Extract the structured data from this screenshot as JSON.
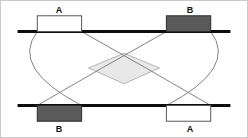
{
  "figure": {
    "title": "",
    "background_color": "#ffffff",
    "border_color": "#c9c9c9"
  },
  "chart_data": {
    "type": "diagram",
    "title": "",
    "xlabel": "",
    "ylabel": "",
    "axis_lines": [
      {
        "name": "top-line",
        "x1": 16,
        "y1": 31,
        "x2": 232,
        "y2": 31,
        "color": "#0d0d0d",
        "width": 3
      },
      {
        "name": "bottom-line",
        "x1": 16,
        "y1": 106,
        "x2": 232,
        "y2": 106,
        "color": "#0d0d0d",
        "width": 3
      }
    ],
    "blocks": [
      {
        "label": "A",
        "position": "top-left",
        "x": 36,
        "y": 15,
        "width": 45,
        "height": 16,
        "fill": "#ffffff",
        "stroke": "#555555",
        "label_y": 5,
        "label_side": "above"
      },
      {
        "label": "B",
        "position": "top-right",
        "x": 167,
        "y": 15,
        "width": 45,
        "height": 16,
        "fill": "#5a5a5a",
        "stroke": "#2b2b2b",
        "label_y": 5,
        "label_side": "above"
      },
      {
        "label": "B",
        "position": "bottom-left",
        "x": 36,
        "y": 106,
        "width": 45,
        "height": 16,
        "fill": "#5a5a5a",
        "stroke": "#2b2b2b",
        "label_y": 124,
        "label_side": "below"
      },
      {
        "label": "A",
        "position": "bottom-right",
        "x": 167,
        "y": 106,
        "width": 45,
        "height": 16,
        "fill": "#ffffff",
        "stroke": "#555555",
        "label_y": 124,
        "label_side": "below"
      }
    ],
    "curves": [
      {
        "name": "arc-left-outer",
        "from": [
          36,
          31
        ],
        "to": [
          81,
          106
        ],
        "control": [
          8,
          68
        ],
        "color": "#808080",
        "width": 1
      },
      {
        "name": "arc-right-outer",
        "from": [
          212,
          31
        ],
        "to": [
          167,
          106
        ],
        "control": [
          240,
          68
        ],
        "color": "#808080",
        "width": 1
      },
      {
        "name": "arc-top-left-to-bottom-right",
        "from": [
          81,
          31
        ],
        "to": [
          212,
          106
        ],
        "control": [
          147,
          68
        ],
        "color": "#808080",
        "width": 1
      },
      {
        "name": "arc-top-right-to-bottom-left",
        "from": [
          167,
          31
        ],
        "to": [
          36,
          106
        ],
        "control": [
          101,
          68
        ],
        "color": "#808080",
        "width": 1
      }
    ],
    "shaded_region": {
      "name": "coupling-overlap",
      "fill": "#e8e8e8",
      "stroke": "#b5b5b5",
      "vertices": [
        [
          124,
          53
        ],
        [
          160,
          68
        ],
        [
          124,
          84
        ],
        [
          88,
          68
        ]
      ]
    },
    "labels": [
      {
        "text": "A",
        "x": 58,
        "y": 5,
        "anchor": "middle"
      },
      {
        "text": "B",
        "x": 189,
        "y": 5,
        "anchor": "middle"
      },
      {
        "text": "B",
        "x": 58,
        "y": 124,
        "anchor": "middle"
      },
      {
        "text": "A",
        "x": 189,
        "y": 124,
        "anchor": "middle"
      }
    ]
  }
}
